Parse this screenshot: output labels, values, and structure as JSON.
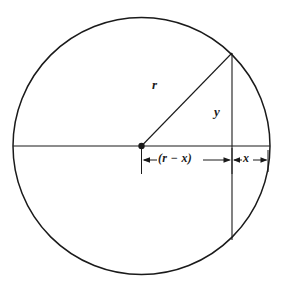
{
  "figure": {
    "type": "geometry-diagram",
    "background_color": "#ffffff",
    "stroke_color": "#1a1a1a",
    "labels": {
      "radius": "r",
      "half_chord": "y",
      "left_segment": "(r − x)",
      "right_segment": "x"
    },
    "geometry": {
      "circle": {
        "center_x": 141.5,
        "center_y": 146,
        "radius": 128.5
      },
      "center_point": {
        "x": 141.5,
        "y": 146,
        "marker": "filled-dot",
        "radius": 3.2
      },
      "horizontal_diameter": {
        "x1": 13,
        "y1": 146,
        "x2": 270,
        "y2": 146
      },
      "vertical_chord": {
        "x": 232,
        "y_top": 53,
        "y_bottom": 240
      },
      "radius_line": {
        "x1": 141.5,
        "y1": 146,
        "x2": 232,
        "y2": 53
      },
      "dimension_line_y": 160,
      "center_tick": {
        "x": 141.5,
        "y_top": 148,
        "y_bottom": 174
      },
      "chord_tick": {
        "x": 232,
        "y_top": 148,
        "y_bottom": 174
      },
      "edge_tick": {
        "x": 268,
        "y_top": 150,
        "y_bottom": 172
      }
    }
  }
}
